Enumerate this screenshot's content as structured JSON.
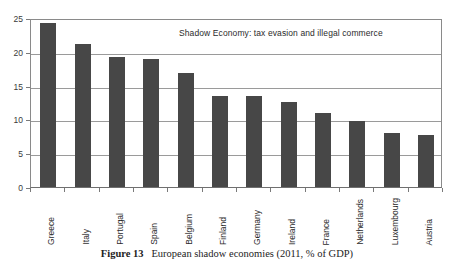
{
  "chart_data": {
    "type": "bar",
    "title": "Shadow Economy: tax evasion and illegal commerce",
    "xlabel": "",
    "ylabel": "",
    "ylim": [
      0,
      25
    ],
    "yticks": [
      0,
      5,
      10,
      15,
      20,
      25
    ],
    "ytick_labels": [
      "0",
      "5",
      "10",
      "15",
      "20",
      "25"
    ],
    "grid": true,
    "legend": "none",
    "bar_color": "#474747",
    "categories": [
      "Greece",
      "Italy",
      "Portugal",
      "Spain",
      "Belgium",
      "Finland",
      "Germany",
      "Ireland",
      "France",
      "Netherlands",
      "Luxembourg",
      "Austria"
    ],
    "values": [
      24.3,
      21.2,
      19.3,
      19.0,
      16.9,
      13.5,
      13.5,
      12.6,
      10.9,
      9.7,
      8.0,
      7.7
    ]
  },
  "caption": {
    "label": "Figure 13",
    "text": "European shadow economies (2011, % of GDP)"
  }
}
